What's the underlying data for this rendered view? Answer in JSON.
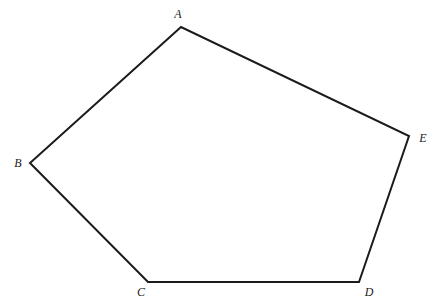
{
  "figure": {
    "kind": "geometry-diagram",
    "shape_name": "pentagon",
    "background_color": "#ffffff",
    "stroke_color": "#1b1b1b",
    "stroke_width": 2,
    "fill_color": "none",
    "canvas": {
      "width": 436,
      "height": 302
    },
    "vertices": [
      {
        "id": "A",
        "label": "A",
        "x": 181,
        "y": 27,
        "label_x": 178,
        "label_y": 14
      },
      {
        "id": "B",
        "label": "B",
        "x": 30,
        "y": 163,
        "label_x": 18,
        "label_y": 163
      },
      {
        "id": "C",
        "label": "C",
        "x": 148,
        "y": 282,
        "label_x": 141,
        "label_y": 292
      },
      {
        "id": "D",
        "label": "D",
        "x": 359,
        "y": 282,
        "label_x": 369,
        "label_y": 292
      },
      {
        "id": "E",
        "label": "E",
        "x": 409,
        "y": 136,
        "label_x": 423,
        "label_y": 138
      }
    ],
    "edges": [
      {
        "from": "A",
        "to": "B"
      },
      {
        "from": "B",
        "to": "C"
      },
      {
        "from": "C",
        "to": "D"
      },
      {
        "from": "D",
        "to": "E"
      },
      {
        "from": "E",
        "to": "A"
      }
    ]
  }
}
